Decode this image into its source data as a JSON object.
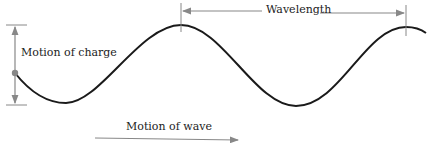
{
  "diagram": {
    "type": "transverse-wave",
    "labels": {
      "charge_motion": "Motion of charge",
      "wavelength": "Wavelength",
      "wave_motion": "Motion of wave"
    },
    "colors": {
      "wave": "#1a1a1a",
      "annotation": "#888888",
      "text": "#222222",
      "background": "#ffffff"
    }
  }
}
